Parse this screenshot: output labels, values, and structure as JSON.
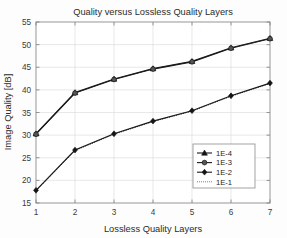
{
  "chart_data": {
    "type": "line",
    "title": "Quality versus Lossless Quality Layers",
    "xlabel": "Lossless Quality Layers",
    "ylabel": "Image Quality [dB]",
    "x": [
      1,
      2,
      3,
      4,
      5,
      6,
      7
    ],
    "xlim": [
      1,
      7
    ],
    "ylim": [
      15,
      55
    ],
    "xticks": [
      "1",
      "2",
      "3",
      "4",
      "5",
      "6",
      "7"
    ],
    "yticks": [
      "15",
      "20",
      "25",
      "30",
      "35",
      "40",
      "45",
      "50",
      "55"
    ],
    "grid": true,
    "legend_position": "center-right",
    "series": [
      {
        "name": "1E-4",
        "marker": "triangle",
        "linestyle": "solid",
        "values": [
          30.3,
          39.4,
          42.4,
          44.7,
          46.3,
          49.3,
          51.4
        ]
      },
      {
        "name": "1E-3",
        "marker": "circle",
        "linestyle": "solid",
        "values": [
          30.2,
          39.3,
          42.3,
          44.6,
          46.2,
          49.2,
          51.3
        ]
      },
      {
        "name": "1E-2",
        "marker": "diamond",
        "linestyle": "solid",
        "values": [
          17.8,
          26.7,
          30.3,
          33.1,
          35.4,
          38.7,
          41.5
        ]
      },
      {
        "name": "1E-1",
        "marker": "none",
        "linestyle": "dotted",
        "values": [
          17.7,
          26.6,
          30.2,
          33.0,
          35.3,
          38.6,
          41.4
        ]
      }
    ]
  },
  "legend": {
    "entries": [
      "1E-4",
      "1E-3",
      "1E-2",
      "1E-1"
    ]
  }
}
